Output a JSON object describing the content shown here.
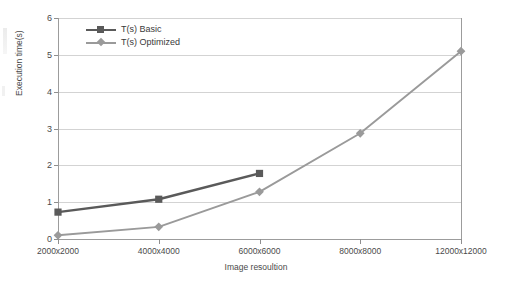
{
  "chart_data": {
    "type": "line",
    "title": "",
    "xlabel": "Image resoultion",
    "ylabel": "Execution time(s)",
    "categories": [
      "2000x2000",
      "4000x4000",
      "6000x6000",
      "8000x8000",
      "12000x12000"
    ],
    "ylim": [
      0,
      6
    ],
    "yticks": [
      0,
      1,
      2,
      3,
      4,
      5,
      6
    ],
    "grid": true,
    "legend_position": "top-left",
    "series": [
      {
        "name": "T(s) Basic",
        "color": "#5a5a5a",
        "marker": "square",
        "values": [
          0.73,
          1.08,
          1.78,
          null,
          null
        ]
      },
      {
        "name": "T(s) Optimized",
        "color": "#9a9a9a",
        "marker": "diamond",
        "values": [
          0.1,
          0.33,
          1.28,
          2.87,
          5.1
        ]
      }
    ]
  },
  "colors": {
    "basic": "#5a5a5a",
    "optimized": "#9a9a9a",
    "grid": "#d3d3d3",
    "axis": "#9c9c9c",
    "text": "#4a4a4a"
  }
}
